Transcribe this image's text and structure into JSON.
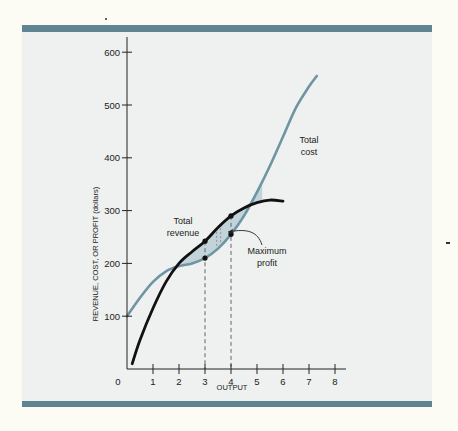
{
  "chart_data": {
    "type": "line",
    "title": "",
    "xlabel": "OUTPUT",
    "ylabel": "REVENUE, COST, OR PROFIT (dollars)",
    "xlim": [
      0,
      8
    ],
    "ylim": [
      0,
      600
    ],
    "x_ticks": [
      "0",
      "1",
      "2",
      "3",
      "4",
      "5",
      "6",
      "7",
      "8"
    ],
    "y_ticks": [
      "100",
      "200",
      "300",
      "400",
      "500",
      "600"
    ],
    "grid": false,
    "legend": "none (curves labeled directly)",
    "series": [
      {
        "name": "Total cost",
        "color": "#6f95a3",
        "x": [
          0,
          0.5,
          1,
          1.5,
          2,
          2.5,
          3,
          3.5,
          4,
          4.5,
          5,
          5.5,
          6,
          6.5,
          7,
          7.3
        ],
        "y": [
          100,
          135,
          165,
          185,
          195,
          200,
          210,
          228,
          255,
          290,
          335,
          385,
          440,
          495,
          535,
          555
        ]
      },
      {
        "name": "Total revenue",
        "color": "#111111",
        "x": [
          0.2,
          0.5,
          1,
          1.5,
          2,
          2.5,
          3,
          3.5,
          4,
          4.5,
          5,
          5.5,
          6
        ],
        "y": [
          10,
          55,
          115,
          165,
          200,
          222,
          242,
          268,
          290,
          305,
          315,
          320,
          318
        ]
      }
    ],
    "points": [
      {
        "series": "Total revenue",
        "x": 3,
        "y": 242
      },
      {
        "series": "Total cost",
        "x": 3,
        "y": 210
      },
      {
        "series": "Total revenue",
        "x": 4,
        "y": 290
      },
      {
        "series": "Total cost",
        "x": 4,
        "y": 255
      }
    ],
    "shaded_region": "area between total revenue and total cost from x≈2 to x≈5 (profit region)",
    "annotations": [
      {
        "text": "Total cost",
        "x": 6.7,
        "y": 400
      },
      {
        "text": "Total revenue",
        "x": 2.5,
        "y": 270
      },
      {
        "text": "Maximum profit",
        "x": 5.6,
        "y": 215,
        "arrow_to": {
          "x": 3.8,
          "y": 270
        }
      }
    ],
    "dashed_lines": [
      {
        "x": 3
      },
      {
        "x": 4
      }
    ]
  },
  "labels": {
    "y_axis": "REVENUE, COST, OR PROFIT (dollars)",
    "x_axis": "OUTPUT",
    "origin": "0",
    "total_cost_line1": "Total",
    "total_cost_line2": "cost",
    "total_revenue_line1": "Total",
    "total_revenue_line2": "revenue",
    "max_profit_line1": "Maximum",
    "max_profit_line2": "profit"
  }
}
